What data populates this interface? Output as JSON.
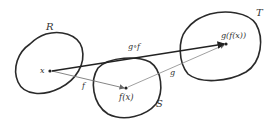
{
  "diagram": {
    "title": "",
    "sets": [
      {
        "name": "R",
        "label": "R"
      },
      {
        "name": "S",
        "label": "S"
      },
      {
        "name": "T",
        "label": "T"
      }
    ],
    "points": [
      {
        "name": "x",
        "label": "x"
      },
      {
        "name": "fx",
        "label": "f(x)"
      },
      {
        "name": "gfx",
        "label": "g(f(x))"
      }
    ],
    "arrows": [
      {
        "name": "f",
        "label": "f"
      },
      {
        "name": "g",
        "label": "g"
      },
      {
        "name": "gof",
        "label": "g∘f"
      }
    ],
    "colors": {
      "outline": "#2a2a2a",
      "thin_arrow": "#777777",
      "thick_arrow": "#222222"
    }
  }
}
